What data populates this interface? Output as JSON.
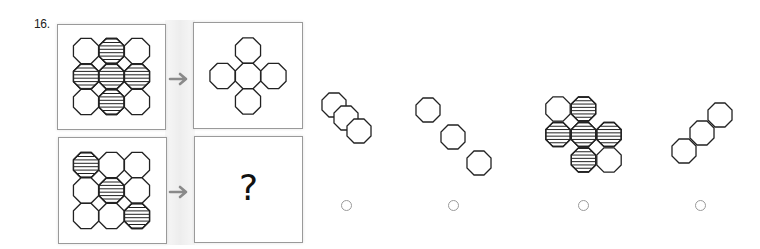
{
  "question": {
    "number_label": "16.",
    "unknown_label": "?"
  },
  "colors": {
    "stroke": "#222222",
    "box_border": "#9a9a9a",
    "arrow": "#8a8a8a",
    "radio": "#9a9a9a"
  },
  "example": {
    "input_grid": {
      "rows": 3,
      "cols": 3,
      "striped": [
        [
          false,
          true,
          false
        ],
        [
          true,
          true,
          true
        ],
        [
          false,
          true,
          false
        ]
      ]
    },
    "output_shape": "plus of 5 plain octagons (top, left, center, right, bottom)"
  },
  "problem": {
    "input_grid": {
      "rows": 3,
      "cols": 3,
      "striped": [
        [
          true,
          false,
          false
        ],
        [
          false,
          true,
          false
        ],
        [
          false,
          false,
          true
        ]
      ]
    },
    "output": "?"
  },
  "options": [
    {
      "id": "A",
      "description": "three overlapping plain octagons along diagonal",
      "selected": false
    },
    {
      "id": "B",
      "description": "three separate plain octagons along diagonal",
      "selected": false
    },
    {
      "id": "C",
      "description": "partial grid of 7 octagons, mostly striped",
      "selected": false
    },
    {
      "id": "D",
      "description": "three touching plain octagons along anti-diagonal",
      "selected": false
    }
  ]
}
